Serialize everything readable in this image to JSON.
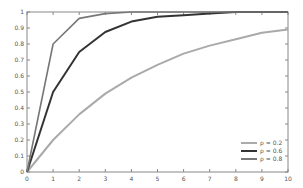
{
  "chart_data": {
    "type": "line",
    "title": "",
    "xlabel": "",
    "ylabel": "",
    "xlim": [
      0,
      10
    ],
    "ylim": [
      0,
      1
    ],
    "grid": false,
    "legend_position": "lower right",
    "x_ticks": [
      "0",
      "1",
      "2",
      "3",
      "4",
      "5",
      "6",
      "7",
      "8",
      "9",
      "10"
    ],
    "y_ticks": [
      "0",
      "0.1",
      "0.2",
      "0.3",
      "0.4",
      "0.5",
      "0.6",
      "0.7",
      "0.8",
      "0.9",
      "1"
    ],
    "x": [
      0,
      1,
      2,
      3,
      4,
      5,
      6,
      7,
      8,
      9,
      10
    ],
    "series": [
      {
        "name": "ρ = 0.2",
        "color": "#aaaaaa",
        "width": 2,
        "values": [
          0,
          0.2,
          0.36,
          0.49,
          0.59,
          0.67,
          0.74,
          0.79,
          0.83,
          0.87,
          0.89
        ]
      },
      {
        "name": "ρ = 0.6",
        "color": "#333333",
        "width": 2,
        "values": [
          0,
          0.5,
          0.75,
          0.875,
          0.94,
          0.97,
          0.98,
          0.99,
          1.0,
          1.0,
          1.0
        ]
      },
      {
        "name": "ρ = 0.8",
        "color": "#777777",
        "width": 1.6,
        "values": [
          0,
          0.8,
          0.96,
          0.99,
          1.0,
          1.0,
          1.0,
          1.0,
          1.0,
          1.0,
          1.0
        ]
      }
    ]
  }
}
